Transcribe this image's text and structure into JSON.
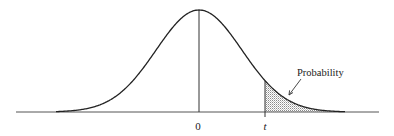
{
  "chart_data": {
    "type": "area",
    "title": "",
    "xlabel": "",
    "ylabel": "",
    "tick_labels": [
      {
        "label": "0",
        "position": "center"
      },
      {
        "label": "t",
        "position": "critical value"
      }
    ],
    "shaded_region": {
      "from": "t",
      "to": "+infinity",
      "fill": "dotted gray stipple"
    },
    "annotation": {
      "text": "Probability",
      "arrow_to": "shaded tail region"
    },
    "grid": false,
    "legend": null
  },
  "figure": {
    "center_label": "0",
    "critical_label": "t",
    "annotation_label": "Probability",
    "colors": {
      "curve": "#222222",
      "axis": "#555555",
      "shade_dot": "#8a8a8a",
      "background": "#ffffff"
    }
  }
}
